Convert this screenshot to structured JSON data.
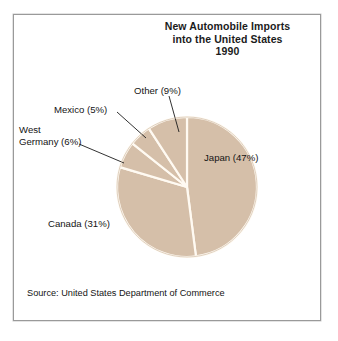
{
  "figure": {
    "frame_border_color": "#9a9a9a",
    "background_color": "#ffffff"
  },
  "chart_data": {
    "type": "pie",
    "title": "New Automobile Imports into the United States 1990",
    "title_lines": [
      "New Automobile Imports",
      "into the United States",
      "1990"
    ],
    "xlabel": "",
    "ylabel": "",
    "units": "percent",
    "legend_position": "none",
    "grid": false,
    "slice_color": "#d5bfa9",
    "separator_color": "#fffaf2",
    "categories": [
      "Japan",
      "Canada",
      "West Germany",
      "Mexico",
      "Other"
    ],
    "values": [
      47,
      31,
      6,
      5,
      9
    ],
    "slices": [
      {
        "name": "Japan",
        "value": 47,
        "label": "Japan (47%)",
        "label_placement": "inside"
      },
      {
        "name": "Canada",
        "value": 31,
        "label": "Canada (31%)",
        "label_placement": "outside"
      },
      {
        "name": "West Germany",
        "value": 6,
        "label": "West Germany (6%)",
        "label_placement": "outside-leader"
      },
      {
        "name": "Mexico",
        "value": 5,
        "label": "Mexico (5%)",
        "label_placement": "outside-leader"
      },
      {
        "name": "Other",
        "value": 9,
        "label": "Other (9%)",
        "label_placement": "outside-leader"
      }
    ],
    "annotations": {
      "source": "Source: United States Department of Commerce"
    }
  },
  "labels": {
    "other": "Other (9%)",
    "mexico": "Mexico (5%)",
    "germany_line1": "West",
    "germany_line2": "Germany (6%)",
    "japan": "Japan (47%)",
    "canada": "Canada (31%)"
  },
  "source": {
    "text": "Source: United States Department of Commerce"
  }
}
